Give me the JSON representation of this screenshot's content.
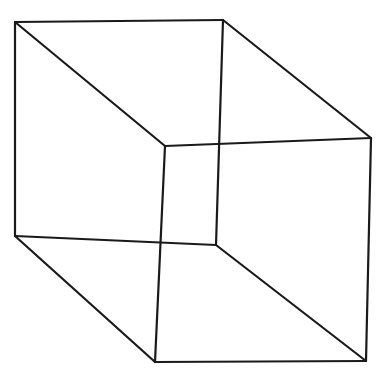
{
  "figure": {
    "background": "#ffffff",
    "stroke_color": "#1a1a1a",
    "stroke_width": 2.2,
    "vertices": {
      "back_top_left": [
        15,
        22
      ],
      "back_top_right": [
        223,
        20
      ],
      "back_bottom_left": [
        15,
        236
      ],
      "back_bottom_right": [
        216,
        245
      ],
      "front_top_left": [
        165,
        146
      ],
      "front_top_right": [
        371,
        138
      ],
      "front_bottom_left": [
        155,
        362
      ],
      "front_bottom_right": [
        366,
        361
      ]
    },
    "edges": [
      [
        "back_top_left",
        "back_top_right"
      ],
      [
        "back_top_left",
        "back_bottom_left"
      ],
      [
        "back_top_left",
        "front_top_left"
      ],
      [
        "back_top_right",
        "front_top_right"
      ],
      [
        "back_top_right",
        "back_bottom_right"
      ],
      [
        "front_top_left",
        "front_top_right"
      ],
      [
        "front_top_left",
        "front_bottom_left"
      ],
      [
        "back_bottom_left",
        "back_bottom_right"
      ],
      [
        "back_bottom_left",
        "front_bottom_left"
      ],
      [
        "front_top_right",
        "front_bottom_right"
      ],
      [
        "back_bottom_right",
        "front_bottom_right"
      ],
      [
        "front_bottom_left",
        "front_bottom_right"
      ]
    ]
  }
}
